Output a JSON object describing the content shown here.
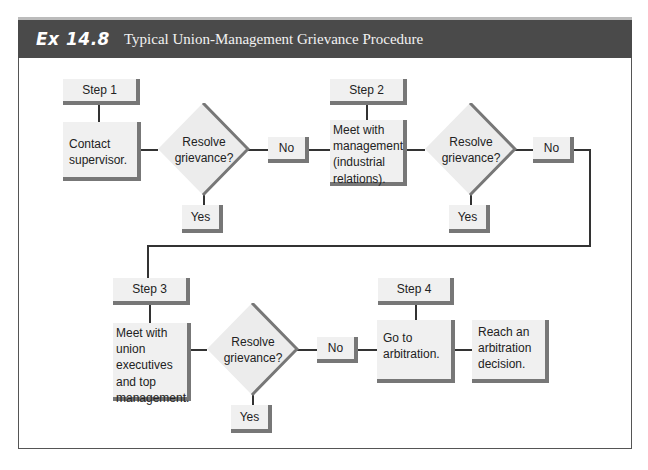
{
  "header": {
    "exhibit_number": "Ex 14.8",
    "title": "Typical Union-Management Grievance Procedure"
  },
  "steps": [
    {
      "label": "Step 1",
      "action": "Contact supervisor.",
      "decision": "Resolve grievance?",
      "yes": "Yes",
      "no": "No"
    },
    {
      "label": "Step 2",
      "action": "Meet with management (industrial relations).",
      "decision": "Resolve grievance?",
      "yes": "Yes",
      "no": "No"
    },
    {
      "label": "Step 3",
      "action": "Meet with union executives and top management.",
      "decision": "Resolve grievance?",
      "yes": "Yes",
      "no": "No"
    },
    {
      "label": "Step 4",
      "action": "Go to arbitration.",
      "outcome": "Reach an arbitration decision."
    }
  ],
  "colors": {
    "header_bg": "#4a4a4a",
    "box_bg": "#f0f0f0",
    "shadow": "#777777",
    "line": "#333333"
  }
}
